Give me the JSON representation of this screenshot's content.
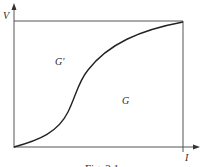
{
  "figure": {
    "caption": "Fig. 3.1",
    "y_axis_label": "V",
    "x_axis_label": "I",
    "region_upper_label": "G'",
    "region_lower_label": "G"
  },
  "colors": {
    "line": "#333333",
    "background": "#ffffff"
  }
}
